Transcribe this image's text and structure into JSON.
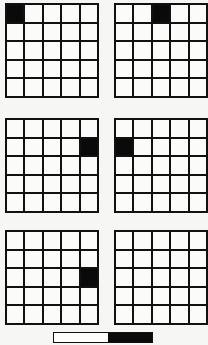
{
  "figure": {
    "background_color": "#f6f6f4",
    "ink_color": "#0a0a0a",
    "cell_color": "#fbfbfa",
    "grid_rows": 5,
    "grid_cols": 5,
    "panel_label": "",
    "boards": [
      {
        "name": "board-top-left",
        "position": "top-left",
        "filled_cells": [
          {
            "row": 1,
            "col": 1
          }
        ],
        "filled_count": 1
      },
      {
        "name": "board-top-right",
        "position": "top-right",
        "filled_cells": [
          {
            "row": 1,
            "col": 3
          }
        ],
        "filled_count": 1
      },
      {
        "name": "board-middle-left",
        "position": "middle-left",
        "filled_cells": [
          {
            "row": 2,
            "col": 5
          }
        ],
        "filled_count": 1
      },
      {
        "name": "board-middle-right",
        "position": "middle-right",
        "filled_cells": [
          {
            "row": 2,
            "col": 1
          }
        ],
        "filled_count": 1
      },
      {
        "name": "board-bottom-left",
        "position": "bottom-left",
        "filled_cells": [
          {
            "row": 3,
            "col": 5
          }
        ],
        "filled_count": 1
      },
      {
        "name": "board-bottom-right",
        "position": "bottom-right",
        "filled_cells": [],
        "filled_count": 0
      }
    ]
  },
  "scale_bar": {
    "name": "scale-bar",
    "light_fraction": 0.55,
    "dark_fraction": 0.45,
    "light_color": "#fdfdfc",
    "dark_color": "#0a0a0a",
    "label": ""
  }
}
